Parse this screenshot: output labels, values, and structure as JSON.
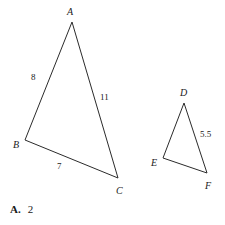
{
  "figure": {
    "background_color": "#ffffff",
    "stroke_color": "#2b2b2b",
    "stroke_width": 1,
    "triangles": [
      {
        "name": "triangle-abc",
        "vertices": [
          {
            "label": "A",
            "x": 72,
            "y": 22,
            "label_x": 67,
            "label_y": 7
          },
          {
            "label": "B",
            "x": 25,
            "y": 140,
            "label_x": 13,
            "label_y": 140
          },
          {
            "label": "C",
            "x": 118,
            "y": 178,
            "label_x": 116,
            "label_y": 186
          }
        ],
        "sides": [
          {
            "name": "side-ab",
            "value": "8",
            "label_x": 31,
            "label_y": 73
          },
          {
            "name": "side-ac",
            "value": "11",
            "label_x": 100,
            "label_y": 93
          },
          {
            "name": "side-bc",
            "value": "7",
            "label_x": 57,
            "label_y": 162
          }
        ]
      },
      {
        "name": "triangle-def",
        "vertices": [
          {
            "label": "D",
            "x": 184,
            "y": 103,
            "label_x": 180,
            "label_y": 88
          },
          {
            "label": "E",
            "x": 163,
            "y": 158,
            "label_x": 151,
            "label_y": 158
          },
          {
            "label": "F",
            "x": 207,
            "y": 173,
            "label_x": 205,
            "label_y": 181
          }
        ],
        "sides": [
          {
            "name": "side-df",
            "value": "5.5",
            "label_x": 200,
            "label_y": 130
          }
        ]
      }
    ]
  },
  "answer": {
    "letter": "A.",
    "value": "2"
  }
}
